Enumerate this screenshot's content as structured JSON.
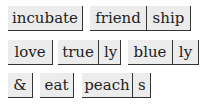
{
  "tiles": [
    {
      "parts": [
        "incubate"
      ]
    },
    {
      "parts": [
        "friend",
        "ship"
      ]
    },
    {
      "parts": [
        "love"
      ]
    },
    {
      "parts": [
        "true",
        "ly"
      ]
    },
    {
      "parts": [
        "blue",
        "ly"
      ]
    },
    {
      "parts": [
        "&"
      ]
    },
    {
      "parts": [
        "eat"
      ]
    },
    {
      "parts": [
        "peach",
        "s"
      ]
    }
  ],
  "colors": {
    "tile_bg": "#ececec",
    "border": "#333333",
    "text": "#222222"
  }
}
